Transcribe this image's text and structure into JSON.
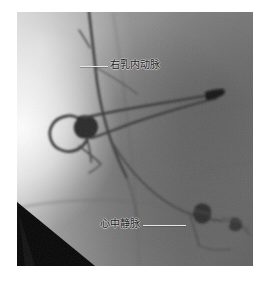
{
  "image": {
    "kind": "coronary-angiography-fluoroscopy-frame",
    "modality_label": "angiogram",
    "frame": {
      "x": 17,
      "y": 12,
      "width": 236,
      "height": 254
    },
    "background_color": "#7d7d7d",
    "bright_region_color": "#f2f2f2",
    "vessel_color": "#3a3a3a",
    "catheter_tip_color": "#151515",
    "corner_wedge_color": "#090909",
    "page_background": "#ffffff"
  },
  "annotations": [
    {
      "id": "rima",
      "text": "右乳内动脉",
      "leader": {
        "x": 80,
        "y": 66,
        "length": 28,
        "direction": "right"
      },
      "text_position": {
        "x": 110,
        "y": 60
      },
      "color": "#1c1c1c",
      "leader_color": "#e8e8e8"
    },
    {
      "id": "mcv",
      "text": "心中静脉",
      "leader": {
        "x": 143,
        "y": 225,
        "length": 43,
        "direction": "right"
      },
      "text_position": {
        "x": 100,
        "y": 219
      },
      "color": "#1c1c1c",
      "leader_color": "#e8e8e8"
    }
  ],
  "structures": [
    {
      "name": "internal-mammary-artery",
      "description": "vertical contrast-filled vessel descending from the top of the frame"
    },
    {
      "name": "catheter-loop",
      "description": "looped guiding catheter at mid-left"
    },
    {
      "name": "catheter-tip",
      "description": "radio-opaque dark tip at right of mid-field"
    },
    {
      "name": "middle-cardiac-vein",
      "description": "branching venous structure in the lower right field"
    },
    {
      "name": "corner-wedge",
      "description": "black collimator wedge at lower-left corner"
    }
  ]
}
